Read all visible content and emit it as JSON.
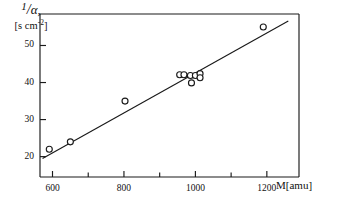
{
  "chart_data": {
    "type": "scatter",
    "title": "",
    "subtitle": "",
    "xlabel": "M[amu]",
    "ylabel": "1/α,",
    "ylabel_units": "[s cm-2]",
    "ylabel_units_base": "[s cm",
    "ylabel_units_exp": "-2",
    "ylabel_units_close": "]",
    "ylabel_numerator": "1",
    "ylabel_slash": "/",
    "ylabel_denominator": "α",
    "ylabel_comma": ",",
    "xlim": [
      565,
      1290
    ],
    "ylim": [
      14.5,
      58.5
    ],
    "xticks_major": [
      600,
      800,
      1000,
      1200
    ],
    "xticks_major_labels": [
      "600",
      "800",
      "1000",
      "1200"
    ],
    "xticks_minor": [
      700,
      900,
      1100
    ],
    "yticks_major": [
      20,
      30,
      40,
      50
    ],
    "yticks_major_labels": [
      "20",
      "30",
      "40",
      "50"
    ],
    "grid": false,
    "legend": "none",
    "marker": "open-circle",
    "points": [
      {
        "x": 591,
        "y": 22.0
      },
      {
        "x": 650,
        "y": 24.0
      },
      {
        "x": 803,
        "y": 35.0
      },
      {
        "x": 956,
        "y": 42.1
      },
      {
        "x": 968,
        "y": 42.1
      },
      {
        "x": 986,
        "y": 41.9
      },
      {
        "x": 989,
        "y": 39.9
      },
      {
        "x": 1000,
        "y": 41.9
      },
      {
        "x": 1013,
        "y": 42.4
      },
      {
        "x": 1013,
        "y": 41.3
      },
      {
        "x": 1190,
        "y": 55.0
      }
    ],
    "fit_line": {
      "type": "line",
      "x": [
        572,
        1260
      ],
      "y": [
        19.5,
        56.6
      ],
      "label": ""
    }
  }
}
